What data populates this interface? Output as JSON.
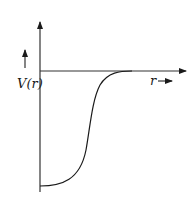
{
  "figure": {
    "y_axis_label": "V(r)",
    "x_axis_label": "r"
  },
  "colors": {
    "background": "#ffffff",
    "ink": "#1a1a1a"
  }
}
